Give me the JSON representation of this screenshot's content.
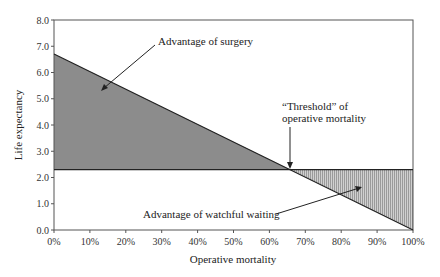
{
  "chart_data": {
    "type": "area",
    "title": "",
    "xlabel": "Operative mortality",
    "ylabel": "Life expectancy",
    "xlim": [
      0,
      100
    ],
    "ylim": [
      0,
      8
    ],
    "x_ticks": [
      "0%",
      "10%",
      "20%",
      "30%",
      "40%",
      "50%",
      "60%",
      "70%",
      "80%",
      "90%",
      "100%"
    ],
    "y_ticks": [
      "0.0",
      "1.0",
      "2.0",
      "3.0",
      "4.0",
      "5.0",
      "6.0",
      "7.0",
      "8.0"
    ],
    "grid": false,
    "series": [
      {
        "name": "Surgery",
        "x": [
          0,
          100
        ],
        "y": [
          6.7,
          0.0
        ]
      },
      {
        "name": "Watchful waiting",
        "x": [
          0,
          100
        ],
        "y": [
          2.3,
          2.3
        ]
      }
    ],
    "threshold": {
      "x": 65.7,
      "y": 2.3
    },
    "regions": [
      {
        "name": "Advantage of surgery",
        "fill": "#8a8a8a",
        "x_range": [
          0,
          65.7
        ]
      },
      {
        "name": "Advantage of watchful waiting",
        "fill": "#c8c8c8",
        "pattern": "dotted",
        "x_range": [
          65.7,
          100
        ]
      }
    ],
    "annotations": [
      {
        "text": "Advantage of  surgery"
      },
      {
        "text": "“Threshold” of",
        "text2": "operative mortality"
      },
      {
        "text": "Advantage of watchful waiting"
      }
    ]
  },
  "labels": {
    "xlabel": "Operative mortality",
    "ylabel": "Life expectancy",
    "ann_surgery": "Advantage of  surgery",
    "ann_threshold_1": "“Threshold” of",
    "ann_threshold_2": "operative mortality",
    "ann_waiting": "Advantage of watchful waiting"
  },
  "x_ticks": [
    "0%",
    "10%",
    "20%",
    "30%",
    "40%",
    "50%",
    "60%",
    "70%",
    "80%",
    "90%",
    "100%"
  ],
  "y_ticks": [
    "0.0",
    "1.0",
    "2.0",
    "3.0",
    "4.0",
    "5.0",
    "6.0",
    "7.0",
    "8.0"
  ]
}
